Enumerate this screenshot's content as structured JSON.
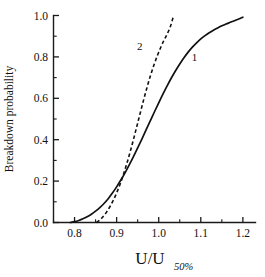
{
  "chart_data": {
    "type": "line",
    "title": "",
    "xlabel": "U/U",
    "xlabel_subscript": "50%",
    "ylabel": "Breakdown probability",
    "xlim": [
      0.75,
      1.23
    ],
    "ylim": [
      0.0,
      1.0
    ],
    "grid": false,
    "legend_position": "inline-annotations",
    "xticks": [
      "0.8",
      "0.9",
      "1.0",
      "1.1",
      "1.2"
    ],
    "xtick_values": [
      0.8,
      0.9,
      1.0,
      1.1,
      1.2
    ],
    "xminor_step": 0.05,
    "yticks": [
      "0.0",
      "0.2",
      "0.4",
      "0.6",
      "0.8",
      "1.0"
    ],
    "ytick_values": [
      0.0,
      0.2,
      0.4,
      0.6,
      0.8,
      1.0
    ],
    "yminor_step": 0.1,
    "series": [
      {
        "name": "1",
        "label": "1",
        "style": "solid",
        "color": "#111111",
        "annotation_x": 1.085,
        "annotation_y": 0.8,
        "x": [
          0.79,
          0.8,
          0.81,
          0.82,
          0.83,
          0.84,
          0.85,
          0.86,
          0.87,
          0.88,
          0.89,
          0.9,
          0.91,
          0.92,
          0.93,
          0.94,
          0.95,
          0.96,
          0.97,
          0.98,
          0.99,
          1.0,
          1.01,
          1.02,
          1.03,
          1.04,
          1.05,
          1.06,
          1.07,
          1.08,
          1.09,
          1.1,
          1.11,
          1.12,
          1.13,
          1.14,
          1.15,
          1.16,
          1.17,
          1.18,
          1.19,
          1.2
        ],
        "y": [
          0.0,
          0.004,
          0.01,
          0.018,
          0.028,
          0.04,
          0.055,
          0.072,
          0.092,
          0.115,
          0.142,
          0.172,
          0.205,
          0.24,
          0.278,
          0.318,
          0.36,
          0.403,
          0.447,
          0.491,
          0.535,
          0.578,
          0.62,
          0.66,
          0.698,
          0.733,
          0.766,
          0.796,
          0.823,
          0.847,
          0.868,
          0.887,
          0.903,
          0.917,
          0.929,
          0.94,
          0.95,
          0.959,
          0.967,
          0.975,
          0.983,
          0.992
        ]
      },
      {
        "name": "2",
        "label": "2",
        "style": "dashed",
        "color": "#111111",
        "annotation_x": 0.955,
        "annotation_y": 0.855,
        "x": [
          0.852,
          0.86,
          0.868,
          0.876,
          0.884,
          0.892,
          0.9,
          0.908,
          0.916,
          0.924,
          0.932,
          0.94,
          0.948,
          0.956,
          0.964,
          0.972,
          0.98,
          0.988,
          0.996,
          1.004,
          1.012,
          1.02,
          1.028,
          1.034
        ],
        "y": [
          0.0,
          0.012,
          0.029,
          0.05,
          0.076,
          0.107,
          0.143,
          0.184,
          0.231,
          0.283,
          0.34,
          0.401,
          0.464,
          0.528,
          0.591,
          0.651,
          0.707,
          0.757,
          0.802,
          0.842,
          0.878,
          0.91,
          0.948,
          0.99
        ]
      }
    ]
  }
}
